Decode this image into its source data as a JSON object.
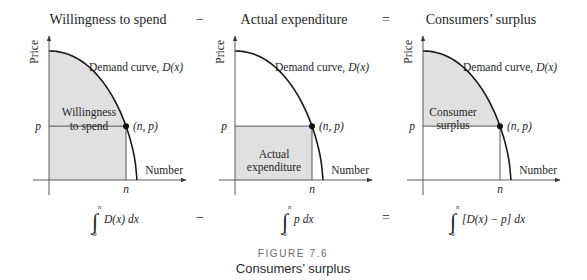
{
  "panels": [
    {
      "title": "Willingness to spend",
      "y_axis_label": "Price",
      "x_axis_label": "Number",
      "curve_label_text": "Demand curve, ",
      "curve_label_func": "D(x)",
      "p_label": "p",
      "n_label": "n",
      "point_label": "(n, p)",
      "region_label_lines": [
        "Willingness",
        "to spend"
      ],
      "shaded_region": "area under D(x) from 0 to n",
      "formula": {
        "lower": "0",
        "upper": "n",
        "integrand": "D(x) dx"
      }
    },
    {
      "title": "Actual expenditure",
      "y_axis_label": "Price",
      "x_axis_label": "Number",
      "curve_label_text": "Demand curve, ",
      "curve_label_func": "D(x)",
      "p_label": "p",
      "n_label": "n",
      "point_label": "(n, p)",
      "region_label_lines": [
        "Actual",
        "expenditure"
      ],
      "shaded_region": "rectangle 0..n by 0..p",
      "formula": {
        "lower": "0",
        "upper": "n",
        "integrand": "p dx"
      }
    },
    {
      "title": "Consumers’ surplus",
      "y_axis_label": "Price",
      "x_axis_label": "Number",
      "curve_label_text": "Demand curve, ",
      "curve_label_func": "D(x)",
      "p_label": "p",
      "n_label": "n",
      "point_label": "(n, p)",
      "region_label_lines": [
        "Consumer",
        "surplus"
      ],
      "shaded_region": "area between D(x) and p from 0 to n",
      "formula": {
        "lower": "0",
        "upper": "n",
        "integrand": "[D(x) − p] dx"
      }
    }
  ],
  "operators": {
    "minus": "−",
    "equals": "="
  },
  "integral_symbol": "∫",
  "caption": {
    "number": "FIGURE 7.6",
    "title": "Consumers’ surplus"
  },
  "colors": {
    "shade": "#e0e0e0",
    "curve": "#1a1a1a",
    "axis": "#5a5a5a"
  }
}
